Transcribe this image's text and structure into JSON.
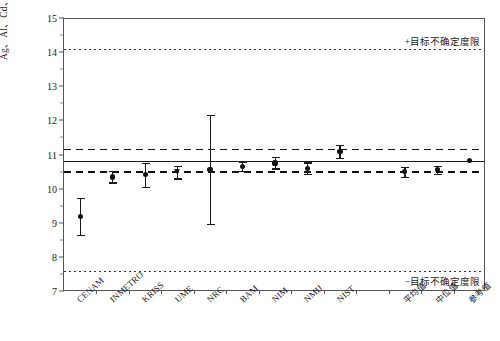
{
  "chart_data": {
    "type": "scatter",
    "title": "",
    "xlabel": "",
    "ylabel": "Ag、Al、Cd、Cr、Ni、Tl质量分数之和（mg/kg）",
    "ylim": [
      7,
      15
    ],
    "ytick_step": 1,
    "ytick_labels": [
      "15",
      "14",
      "13",
      "12",
      "11",
      "10",
      "9",
      "8",
      "7"
    ],
    "grid": false,
    "legend": "none",
    "categories": [
      "CENAM",
      "INMETRO",
      "KRISS",
      "UME",
      "NRC",
      "BAM",
      "NIM",
      "NMIJ",
      "NIST",
      "",
      "平均值",
      "中位值",
      "参考值"
    ],
    "series": [
      {
        "name": "各实验室测量结果",
        "values": [
          9.21,
          10.37,
          10.44,
          10.52,
          10.6,
          10.68,
          10.78,
          10.62,
          11.12,
          null,
          10.52,
          10.58,
          10.85
        ],
        "err_low": [
          8.67,
          10.21,
          10.08,
          10.33,
          9.0,
          10.55,
          10.62,
          10.45,
          10.92,
          null,
          10.38,
          10.46,
          10.85
        ],
        "err_high": [
          9.75,
          10.55,
          10.78,
          10.7,
          12.2,
          10.82,
          10.95,
          10.8,
          11.32,
          null,
          10.66,
          10.7,
          10.85
        ],
        "markers": [
          "circle",
          "circle",
          "circle",
          "triangle",
          "circle",
          "circle",
          "circle",
          "circle",
          "circle",
          null,
          "circle",
          "circle",
          "circle"
        ]
      }
    ],
    "reference_lines": [
      {
        "name": "参考值线",
        "value": 10.85,
        "style": "solid"
      },
      {
        "name": "上不确定度区间",
        "value": 11.2,
        "style": "dashed"
      },
      {
        "name": "下不确定度区间",
        "value": 10.55,
        "style": "dashed"
      },
      {
        "name": "目标不确定度上限",
        "value": 14.12,
        "style": "dotted",
        "label": "+目标不确定度限"
      },
      {
        "name": "目标不确定度下限",
        "value": 7.63,
        "style": "dotted",
        "label": "−目标不确定度限"
      }
    ],
    "annotations": [
      {
        "text": "+目标不确定度限",
        "value": 14.12
      },
      {
        "text": "−目标不确定度限",
        "value": 7.63
      }
    ]
  },
  "colors": {
    "axis": "#555555",
    "marker": "#111111",
    "reference": "#1a1a1a",
    "background": "#ffffff"
  }
}
